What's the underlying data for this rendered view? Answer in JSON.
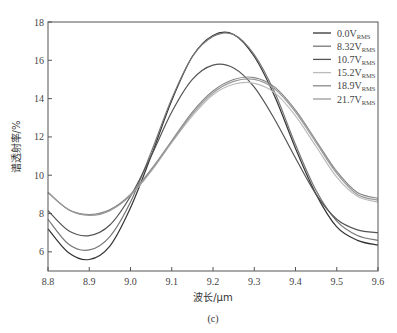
{
  "chart_data": {
    "type": "line",
    "title": "",
    "caption": "(c)",
    "xlabel": "波长/μm",
    "ylabel": "谱透射率/%",
    "xlim": [
      8.8,
      9.6
    ],
    "ylim": [
      5,
      18
    ],
    "xticks": [
      8.8,
      8.9,
      9.0,
      9.1,
      9.2,
      9.3,
      9.4,
      9.5,
      9.6
    ],
    "xtick_labels": [
      "8.8",
      "8.9",
      "9.0",
      "9.1",
      "9.2",
      "9.3",
      "9.4",
      "9.5",
      "9.6"
    ],
    "yticks": [
      6,
      8,
      10,
      12,
      14,
      16,
      18
    ],
    "ytick_labels": [
      "6",
      "8",
      "10",
      "12",
      "14",
      "16",
      "18"
    ],
    "grid": false,
    "legend_position": "upper right",
    "x": [
      8.8,
      8.85,
      8.9,
      8.95,
      9.0,
      9.05,
      9.1,
      9.15,
      9.2,
      9.25,
      9.3,
      9.35,
      9.4,
      9.45,
      9.5,
      9.55,
      9.6
    ],
    "series": [
      {
        "name": "0.0V",
        "subscript": "RMS",
        "color": "#333333",
        "values": [
          7.2,
          5.95,
          5.6,
          6.3,
          8.3,
          11.0,
          13.9,
          16.2,
          17.3,
          17.35,
          16.2,
          14.1,
          11.4,
          9.0,
          7.3,
          6.6,
          6.35
        ]
      },
      {
        "name": "8.32V",
        "subscript": "RMS",
        "color": "#777777",
        "values": [
          7.7,
          6.4,
          6.1,
          6.8,
          8.6,
          11.2,
          14.0,
          16.2,
          17.25,
          17.35,
          16.3,
          14.3,
          11.6,
          9.2,
          7.6,
          6.85,
          6.6
        ]
      },
      {
        "name": "10.7V",
        "subscript": "RMS",
        "color": "#555555",
        "values": [
          8.15,
          7.1,
          6.85,
          7.4,
          8.9,
          11.0,
          13.3,
          15.0,
          15.75,
          15.6,
          14.6,
          12.9,
          10.9,
          9.0,
          7.7,
          7.15,
          7.0
        ]
      },
      {
        "name": "15.2V",
        "subscript": "RMS",
        "color": "#bbbbbb",
        "values": [
          9.1,
          8.2,
          7.95,
          8.2,
          8.95,
          10.2,
          11.7,
          13.1,
          14.2,
          14.75,
          14.8,
          14.3,
          13.1,
          11.5,
          9.9,
          8.9,
          8.6
        ]
      },
      {
        "name": "18.9V",
        "subscript": "RMS",
        "color": "#888888",
        "values": [
          9.1,
          8.2,
          7.95,
          8.2,
          9.0,
          10.3,
          11.8,
          13.3,
          14.4,
          15.0,
          15.1,
          14.6,
          13.4,
          11.8,
          10.2,
          9.1,
          8.8
        ]
      },
      {
        "name": "21.7V",
        "subscript": "RMS",
        "color": "#999999",
        "values": [
          9.1,
          8.2,
          7.9,
          8.15,
          8.95,
          10.25,
          11.75,
          13.2,
          14.3,
          14.9,
          15.0,
          14.5,
          13.3,
          11.7,
          10.1,
          9.0,
          8.7
        ]
      }
    ]
  }
}
